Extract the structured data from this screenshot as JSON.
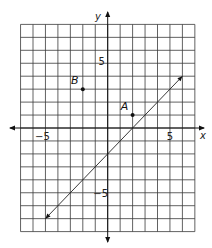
{
  "chart_data": {
    "type": "line",
    "title": "",
    "xlabel": "x",
    "ylabel": "y",
    "xlim": [
      -7,
      7
    ],
    "ylim": [
      -8,
      8
    ],
    "grid": true,
    "tick_labels": {
      "x": [
        {
          "value": -5,
          "label": "−5"
        },
        {
          "value": 5,
          "label": "5"
        }
      ],
      "y": [
        {
          "value": 5,
          "label": "5"
        },
        {
          "value": -5,
          "label": "−5"
        }
      ]
    },
    "points": [
      {
        "name": "A",
        "x": 2,
        "y": 1
      },
      {
        "name": "B",
        "x": -2,
        "y": 3
      }
    ],
    "series": [
      {
        "name": "line",
        "equation": "y = x - 2",
        "x": [
          -5,
          6
        ],
        "y": [
          -7,
          4
        ],
        "arrows": "both"
      }
    ]
  }
}
